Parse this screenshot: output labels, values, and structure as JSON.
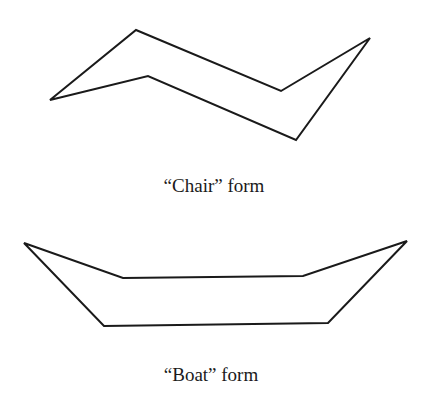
{
  "diagram": {
    "stroke_color": "#1a1a1a",
    "background": "#ffffff",
    "chair": {
      "label": "“Chair” form",
      "points": "50,100 136,30 281,91 370,38 296,140 148,76"
    },
    "boat": {
      "label": "“Boat” form",
      "points": "24,243 123,278 303,276 407,241 328,323 104,326"
    }
  }
}
